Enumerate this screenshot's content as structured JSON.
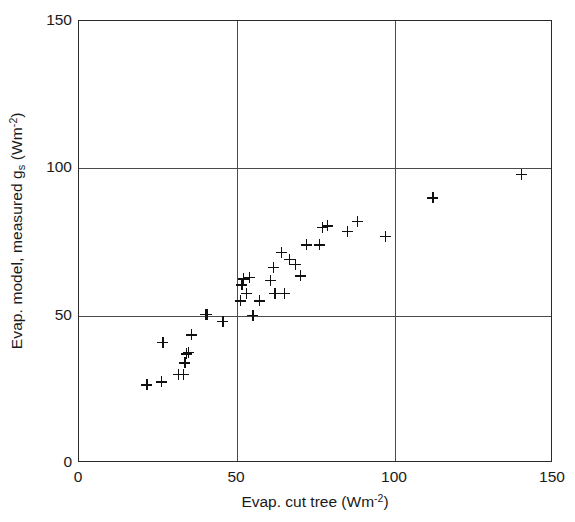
{
  "chart_data": {
    "type": "scatter",
    "title": "",
    "xlabel": "Evap. cut tree (Wm-2)",
    "xlabel_parts": {
      "main": "Evap. cut tree (Wm",
      "sup": "-2",
      "tail": ")"
    },
    "ylabel": "Evap. model, measured gs (Wm-2)",
    "ylabel_parts": {
      "pre": "Evap. model, measured g",
      "sub": "s",
      "mid": " (Wm",
      "sup": "-2",
      "tail": ")"
    },
    "xlim": [
      0,
      150
    ],
    "ylim": [
      0,
      150
    ],
    "xticks": [
      0,
      50,
      100,
      150
    ],
    "yticks": [
      0,
      50,
      100,
      150
    ],
    "xticklabels": [
      "0",
      "50",
      "100",
      "150"
    ],
    "yticklabels": [
      "0",
      "50",
      "100",
      "150"
    ],
    "grid": true,
    "gridlines_x": [
      50,
      100
    ],
    "gridlines_y": [
      50,
      100
    ],
    "legend": null,
    "marker": "plus",
    "marker_color": "#111111",
    "frame_color": "#2a2a2a",
    "series": [
      {
        "name": "Evap. model vs measured gs",
        "points": [
          [
            21.5,
            26.5
          ],
          [
            26.0,
            27.5
          ],
          [
            31.5,
            30.0
          ],
          [
            33.0,
            30.0
          ],
          [
            33.5,
            34.0
          ],
          [
            26.5,
            41.0
          ],
          [
            34.0,
            37.0
          ],
          [
            34.5,
            37.5
          ],
          [
            35.5,
            43.5
          ],
          [
            40.0,
            50.5
          ],
          [
            40.5,
            50.5
          ],
          [
            45.5,
            48.0
          ],
          [
            51.0,
            55.0
          ],
          [
            53.0,
            57.5
          ],
          [
            57.0,
            55.0
          ],
          [
            51.5,
            60.5
          ],
          [
            52.0,
            62.5
          ],
          [
            54.0,
            63.0
          ],
          [
            55.0,
            50.0
          ],
          [
            60.5,
            62.0
          ],
          [
            62.0,
            57.5
          ],
          [
            65.0,
            57.5
          ],
          [
            61.5,
            66.5
          ],
          [
            64.0,
            71.5
          ],
          [
            66.5,
            69.0
          ],
          [
            68.5,
            67.5
          ],
          [
            70.0,
            63.5
          ],
          [
            72.0,
            74.0
          ],
          [
            76.0,
            74.0
          ],
          [
            77.0,
            80.0
          ],
          [
            78.5,
            80.5
          ],
          [
            85.0,
            78.5
          ],
          [
            88.0,
            82.0
          ],
          [
            97.0,
            77.0
          ],
          [
            112.0,
            90.0
          ],
          [
            140.0,
            98.0
          ]
        ]
      }
    ]
  }
}
